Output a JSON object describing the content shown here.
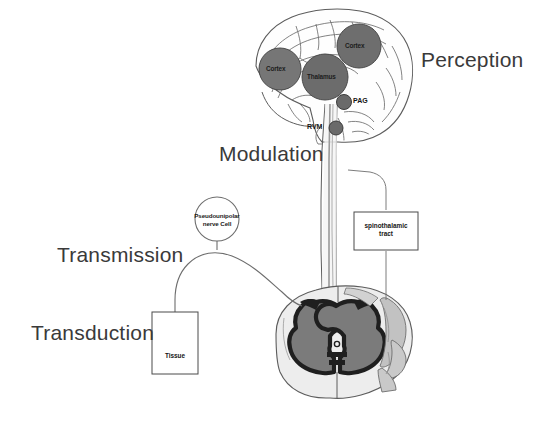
{
  "figure": {
    "background_color": "#ffffff",
    "stages": [
      {
        "id": "perception",
        "label": "Perception"
      },
      {
        "id": "modulation",
        "label": "Modulation"
      },
      {
        "id": "transmission",
        "label": "Transmission"
      },
      {
        "id": "transduction",
        "label": "Transduction"
      }
    ],
    "brain_regions": [
      {
        "id": "cortex-left",
        "label": "Cortex",
        "fill": "#767676"
      },
      {
        "id": "cortex-right",
        "label": "Cortex",
        "fill": "#6e6e6e"
      },
      {
        "id": "thalamus",
        "label": "Thalamus",
        "fill": "#6c6c6c"
      }
    ],
    "brainstem_nodes": [
      {
        "id": "pag",
        "label": "PAG",
        "fill": "#6a6a6a"
      },
      {
        "id": "rvm",
        "label": "RVM",
        "fill": "#6a6a6a"
      }
    ],
    "callouts": [
      {
        "id": "nerve-cell",
        "line1": "Pseudounipolar",
        "line2": "nerve Cell",
        "shape": "circle"
      },
      {
        "id": "spinothalamic-tract",
        "line1": "spinothalamic",
        "line2": "tract",
        "shape": "box"
      },
      {
        "id": "tissue",
        "line1": "Tissue",
        "line2": "",
        "shape": "box"
      }
    ],
    "colors": {
      "outline": "#595959",
      "gray_matter_dark": "#2b2b2b",
      "gray_matter_mid": "#7a7a7a",
      "white_matter": "#e8e8e8",
      "tract_light": "#bcbcbc",
      "text": "#3a3a3a"
    }
  }
}
